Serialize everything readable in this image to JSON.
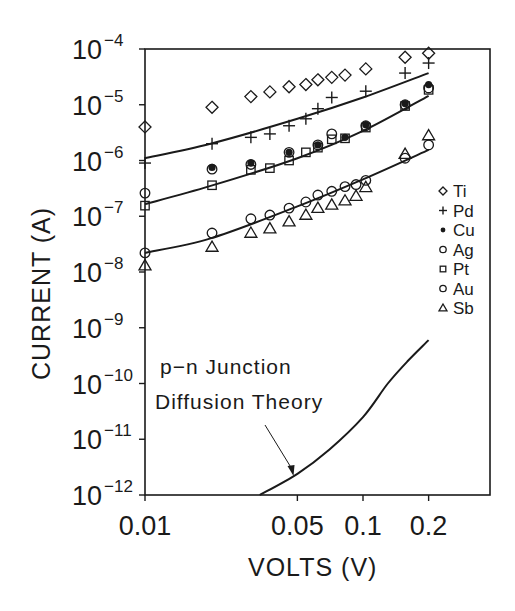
{
  "chart_data": {
    "type": "scatter",
    "title": "",
    "xlabel": "VOLTS (V)",
    "ylabel": "CURRENT (A)",
    "xscale": "log",
    "yscale": "log",
    "xlim": [
      0.01,
      0.38
    ],
    "ylim": [
      1e-12,
      0.0001
    ],
    "grid": false,
    "legend_position": "right, inside plot",
    "x_ticks": [
      {
        "value": 0.01,
        "label": "0.01"
      },
      {
        "value": 0.05,
        "label": "0.05"
      },
      {
        "value": 0.1,
        "label": "0.1"
      },
      {
        "value": 0.2,
        "label": "0.2"
      }
    ],
    "y_ticks": [
      {
        "value": 0.0001,
        "base": "10",
        "exp": "−4"
      },
      {
        "value": 1e-05,
        "base": "10",
        "exp": "−5"
      },
      {
        "value": 1e-06,
        "base": "10",
        "exp": "−6"
      },
      {
        "value": 1e-07,
        "base": "10",
        "exp": "−7"
      },
      {
        "value": 1e-08,
        "base": "10",
        "exp": "−8"
      },
      {
        "value": 1e-09,
        "base": "10",
        "exp": "−9"
      },
      {
        "value": 1e-10,
        "base": "10",
        "exp": "−10"
      },
      {
        "value": 1e-11,
        "base": "10",
        "exp": "−11"
      },
      {
        "value": 1e-12,
        "base": "10",
        "exp": "−12"
      }
    ],
    "series": [
      {
        "name": "Ti",
        "marker": "diamond",
        "points": [
          [
            0.01,
            4e-06
          ],
          [
            0.0203,
            9e-06
          ],
          [
            0.0306,
            1.4e-05
          ],
          [
            0.0374,
            1.7e-05
          ],
          [
            0.0458,
            2.1e-05
          ],
          [
            0.0547,
            2.3e-05
          ],
          [
            0.0621,
            2.8e-05
          ],
          [
            0.0719,
            3.1e-05
          ],
          [
            0.0827,
            3.4e-05
          ],
          [
            0.103,
            4.4e-05
          ],
          [
            0.156,
            7.1e-05
          ],
          [
            0.2,
            8.4e-05
          ]
        ]
      },
      {
        "name": "Pd",
        "marker": "plus",
        "points": [
          [
            0.01,
            9e-07
          ],
          [
            0.0203,
            2e-06
          ],
          [
            0.0306,
            2.6e-06
          ],
          [
            0.0374,
            3e-06
          ],
          [
            0.0458,
            4.2e-06
          ],
          [
            0.0547,
            5.6e-06
          ],
          [
            0.0621,
            8.5e-06
          ],
          [
            0.0719,
            1.35e-05
          ],
          [
            0.103,
            1.75e-05
          ],
          [
            0.156,
            3.7e-05
          ],
          [
            0.2,
            5.6e-05
          ]
        ]
      },
      {
        "name": "Cu",
        "marker": "dot",
        "points": [
          [
            0.0203,
            7.5e-07
          ],
          [
            0.0306,
            9e-07
          ],
          [
            0.0458,
            1.4e-06
          ],
          [
            0.0621,
            1.9e-06
          ],
          [
            0.0827,
            2.6e-06
          ],
          [
            0.103,
            4.4e-06
          ],
          [
            0.156,
            1.05e-05
          ],
          [
            0.2,
            2.3e-05
          ]
        ]
      },
      {
        "name": "Ag",
        "marker": "circle",
        "points": [
          [
            0.01,
            2.6e-07
          ],
          [
            0.0203,
            7e-07
          ],
          [
            0.0306,
            8.5e-07
          ],
          [
            0.0458,
            1.4e-06
          ],
          [
            0.0621,
            1.9e-06
          ],
          [
            0.0719,
            3e-06
          ],
          [
            0.103,
            4.2e-06
          ],
          [
            0.156,
            1e-05
          ],
          [
            0.2,
            2e-05
          ]
        ]
      },
      {
        "name": "Pt",
        "marker": "square",
        "points": [
          [
            0.01,
            1.55e-07
          ],
          [
            0.0203,
            3.6e-07
          ],
          [
            0.0306,
            6.8e-07
          ],
          [
            0.0374,
            7.3e-07
          ],
          [
            0.0458,
            1e-06
          ],
          [
            0.0547,
            1.4e-06
          ],
          [
            0.0621,
            1.7e-06
          ],
          [
            0.0719,
            2.4e-06
          ],
          [
            0.0827,
            2.5e-06
          ],
          [
            0.103,
            3.9e-06
          ],
          [
            0.156,
            9.5e-06
          ],
          [
            0.2,
            1.85e-05
          ]
        ]
      },
      {
        "name": "Au",
        "marker": "circle",
        "points": [
          [
            0.01,
            2.2e-08
          ],
          [
            0.0203,
            5e-08
          ],
          [
            0.0306,
            9e-08
          ],
          [
            0.0374,
            1.05e-07
          ],
          [
            0.0458,
            1.4e-07
          ],
          [
            0.0547,
            1.8e-07
          ],
          [
            0.0621,
            2.4e-07
          ],
          [
            0.0719,
            2.8e-07
          ],
          [
            0.0827,
            3.4e-07
          ],
          [
            0.0929,
            3.7e-07
          ],
          [
            0.103,
            4.4e-07
          ],
          [
            0.156,
            1.1e-06
          ],
          [
            0.2,
            1.9e-06
          ]
        ]
      },
      {
        "name": "Sb",
        "marker": "triangle",
        "points": [
          [
            0.01,
            1.3e-08
          ],
          [
            0.0203,
            2.8e-08
          ],
          [
            0.0306,
            5e-08
          ],
          [
            0.0374,
            6e-08
          ],
          [
            0.0458,
            8e-08
          ],
          [
            0.0547,
            1.05e-07
          ],
          [
            0.0621,
            1.4e-07
          ],
          [
            0.0719,
            1.6e-07
          ],
          [
            0.0827,
            1.9e-07
          ],
          [
            0.0929,
            2.3e-07
          ],
          [
            0.103,
            3.3e-07
          ],
          [
            0.156,
            1.3e-06
          ],
          [
            0.2,
            2.8e-06
          ]
        ]
      }
    ],
    "fit_lines": [
      {
        "name": "upper fit (Pd)",
        "points": [
          [
            0.01,
            1.1e-06
          ],
          [
            0.02,
            2e-06
          ],
          [
            0.05,
            5.6e-06
          ],
          [
            0.1,
            1.35e-05
          ],
          [
            0.2,
            3.7e-05
          ]
        ]
      },
      {
        "name": "middle fit (Cu/Ag/Pt)",
        "points": [
          [
            0.01,
            1.65e-07
          ],
          [
            0.02,
            3.5e-07
          ],
          [
            0.05,
            1.1e-06
          ],
          [
            0.1,
            3.4e-06
          ],
          [
            0.2,
            1.45e-05
          ]
        ]
      },
      {
        "name": "lower fit (Au/Sb)",
        "points": [
          [
            0.01,
            2.2e-08
          ],
          [
            0.02,
            4e-08
          ],
          [
            0.05,
            1.5e-07
          ],
          [
            0.1,
            4.6e-07
          ],
          [
            0.2,
            1.55e-06
          ]
        ]
      },
      {
        "name": "p-n junction diffusion theory",
        "points": [
          [
            0.0336,
            1e-12
          ],
          [
            0.05,
            2.4e-12
          ],
          [
            0.07,
            6.5e-12
          ],
          [
            0.1,
            2.5e-11
          ],
          [
            0.13,
            1e-10
          ],
          [
            0.16,
            2.5e-10
          ],
          [
            0.2,
            6e-10
          ]
        ]
      }
    ],
    "annotations": [
      {
        "text_line1": "p−n Junction",
        "text_line2": "Diffusion Theory",
        "arrow_to": [
          0.048,
          2.2e-12
        ]
      }
    ]
  },
  "legend": {
    "items": [
      {
        "label": "Ti",
        "marker": "diamond"
      },
      {
        "label": "Pd",
        "marker": "plus"
      },
      {
        "label": "Cu",
        "marker": "dot"
      },
      {
        "label": "Ag",
        "marker": "circle"
      },
      {
        "label": "Pt",
        "marker": "square"
      },
      {
        "label": "Au",
        "marker": "circle"
      },
      {
        "label": "Sb",
        "marker": "triangle"
      }
    ]
  },
  "axes": {
    "xlabel": "VOLTS (V)",
    "ylabel": "CURRENT (A)"
  },
  "annotation": {
    "line1": "p−n Junction",
    "line2": "Diffusion Theory"
  },
  "colors": {
    "ink": "#1a1a1a",
    "background": "#ffffff"
  }
}
